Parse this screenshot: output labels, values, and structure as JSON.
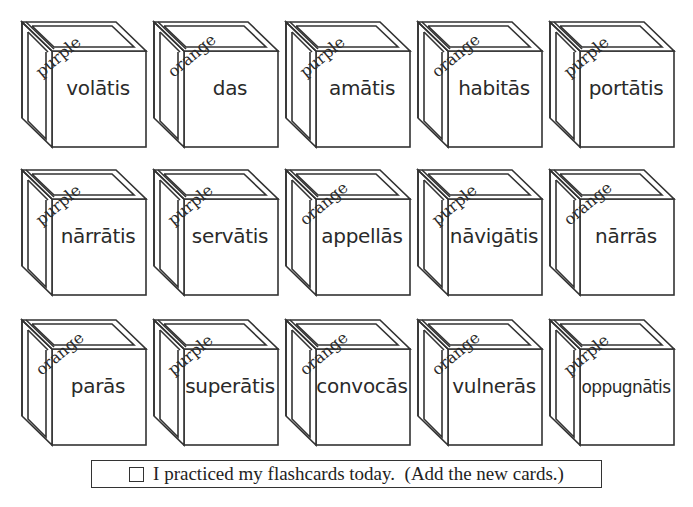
{
  "cards": [
    {
      "word": "volātis",
      "color": "purple"
    },
    {
      "word": "das",
      "color": "orange"
    },
    {
      "word": "amātis",
      "color": "purple"
    },
    {
      "word": "habitās",
      "color": "orange"
    },
    {
      "word": "portātis",
      "color": "purple"
    },
    {
      "word": "nārrātis",
      "color": "purple"
    },
    {
      "word": "servātis",
      "color": "purple"
    },
    {
      "word": "appellās",
      "color": "orange"
    },
    {
      "word": "nāvigātis",
      "color": "purple"
    },
    {
      "word": "nārrās",
      "color": "orange"
    },
    {
      "word": "parās",
      "color": "orange"
    },
    {
      "word": "superātis",
      "color": "purple"
    },
    {
      "word": "convocās",
      "color": "orange"
    },
    {
      "word": "vulnerās",
      "color": "orange"
    },
    {
      "word": "oppugnātis",
      "color": "purple"
    }
  ],
  "footer": {
    "checkbox_checked": false,
    "text": "I practiced my flashcards today.  (Add the new cards.)"
  }
}
